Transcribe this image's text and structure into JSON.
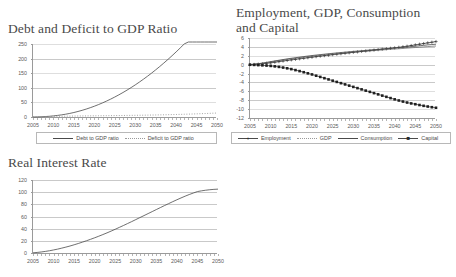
{
  "figure": {
    "background": "#ffffff",
    "grid_color": "#c9c9c9",
    "axis_color": "#9a9a9a",
    "line_color": "#4a4a4a"
  },
  "chart_data": [
    {
      "id": "debt-deficit",
      "type": "line",
      "title": "Debt and Deficit to GDP Ratio",
      "xlabel": "",
      "ylabel": "",
      "xlim": [
        2005,
        2050
      ],
      "ylim": [
        0,
        250
      ],
      "ytick_labels": [
        "250",
        "200",
        "150",
        "100",
        "50",
        "0"
      ],
      "yticks": [
        250,
        200,
        150,
        100,
        50,
        0
      ],
      "xtick_labels": [
        "2005",
        "2010",
        "2015",
        "2020",
        "2025",
        "2030",
        "2035",
        "2040",
        "2045",
        "2050"
      ],
      "xticks": [
        2005,
        2010,
        2015,
        2020,
        2025,
        2030,
        2035,
        2040,
        2045,
        2050
      ],
      "grid": true,
      "legend_position": "bottom",
      "x": [
        2005,
        2006,
        2007,
        2008,
        2009,
        2010,
        2011,
        2012,
        2013,
        2014,
        2015,
        2016,
        2017,
        2018,
        2019,
        2020,
        2021,
        2022,
        2023,
        2024,
        2025,
        2026,
        2027,
        2028,
        2029,
        2030,
        2031,
        2032,
        2033,
        2034,
        2035,
        2036,
        2037,
        2038,
        2039,
        2040,
        2041,
        2042,
        2043,
        2044,
        2045,
        2046,
        2047,
        2048,
        2049,
        2050
      ],
      "series": [
        {
          "name": "Debt to GDP ratio",
          "style": "solid",
          "marker": "none",
          "values": [
            0,
            0.3,
            0.8,
            1.5,
            2.5,
            3.8,
            5.4,
            7.3,
            9.6,
            12.3,
            15.4,
            18.9,
            22.8,
            27.1,
            31.8,
            36.9,
            42.4,
            48.3,
            54.6,
            61.3,
            68.4,
            75.9,
            83.8,
            92.1,
            100.8,
            109.9,
            119.4,
            129.3,
            139.6,
            150.3,
            161.4,
            172.9,
            184.8,
            197.1,
            209.8,
            222.9,
            236.4,
            250.3,
            264.6,
            279.3,
            294.4,
            309.9,
            325.8,
            342.1,
            358.8,
            375.9
          ]
        },
        {
          "name": "Deficit to GDP ratio",
          "style": "dotted",
          "marker": "none",
          "values": [
            0,
            0.4,
            0.8,
            1.2,
            1.6,
            2.0,
            2.3,
            2.6,
            2.9,
            3.1,
            3.3,
            3.5,
            3.7,
            3.8,
            4.0,
            4.1,
            4.3,
            4.4,
            4.6,
            4.7,
            4.9,
            5.0,
            5.2,
            5.4,
            5.6,
            5.8,
            6.0,
            6.2,
            6.5,
            6.7,
            7.0,
            7.3,
            7.6,
            7.9,
            8.3,
            8.6,
            9.0,
            9.4,
            9.8,
            10.3,
            10.8,
            11.3,
            11.8,
            12.4,
            13.0,
            13.6
          ]
        }
      ]
    },
    {
      "id": "employment-gdp-consumption-capital",
      "type": "line",
      "title": "Employment, GDP, Consumption and Capital",
      "xlabel": "",
      "ylabel": "",
      "xlim": [
        2005,
        2050
      ],
      "ylim": [
        -12,
        6
      ],
      "ytick_labels": [
        "6",
        "4",
        "2",
        "0",
        "-2",
        "-4",
        "-6",
        "-8",
        "-10",
        "-12"
      ],
      "yticks": [
        6,
        4,
        2,
        0,
        -2,
        -4,
        -6,
        -8,
        -10,
        -12
      ],
      "xtick_labels": [
        "2005",
        "2010",
        "2015",
        "2020",
        "2025",
        "2030",
        "2035",
        "2040",
        "2045",
        "2050"
      ],
      "xticks": [
        2005,
        2010,
        2015,
        2020,
        2025,
        2030,
        2035,
        2040,
        2045,
        2050
      ],
      "grid": true,
      "legend_position": "bottom",
      "x": [
        2005,
        2006,
        2007,
        2008,
        2009,
        2010,
        2011,
        2012,
        2013,
        2014,
        2015,
        2016,
        2017,
        2018,
        2019,
        2020,
        2021,
        2022,
        2023,
        2024,
        2025,
        2026,
        2027,
        2028,
        2029,
        2030,
        2031,
        2032,
        2033,
        2034,
        2035,
        2036,
        2037,
        2038,
        2039,
        2040,
        2041,
        2042,
        2043,
        2044,
        2045,
        2046,
        2047,
        2048,
        2049,
        2050
      ],
      "series": [
        {
          "name": "Employment",
          "style": "solid",
          "marker": "plus",
          "values": [
            0.0,
            0.05,
            0.12,
            0.2,
            0.3,
            0.42,
            0.55,
            0.68,
            0.82,
            0.95,
            1.08,
            1.2,
            1.32,
            1.44,
            1.56,
            1.68,
            1.8,
            1.92,
            2.03,
            2.14,
            2.25,
            2.36,
            2.46,
            2.57,
            2.67,
            2.78,
            2.88,
            2.98,
            3.08,
            3.18,
            3.28,
            3.38,
            3.48,
            3.58,
            3.68,
            3.78,
            3.9,
            4.02,
            4.15,
            4.3,
            4.45,
            4.6,
            4.75,
            4.9,
            5.05,
            5.2
          ]
        },
        {
          "name": "GDP",
          "style": "solid-thin",
          "marker": "none",
          "values": [
            0.0,
            0.08,
            0.18,
            0.3,
            0.44,
            0.6,
            0.75,
            0.9,
            1.04,
            1.18,
            1.31,
            1.44,
            1.56,
            1.68,
            1.79,
            1.9,
            2.0,
            2.1,
            2.2,
            2.29,
            2.38,
            2.47,
            2.56,
            2.64,
            2.72,
            2.8,
            2.88,
            2.96,
            3.03,
            3.1,
            3.17,
            3.24,
            3.31,
            3.38,
            3.45,
            3.52,
            3.58,
            3.65,
            3.72,
            3.79,
            3.86,
            3.93,
            4.0,
            4.07,
            4.14,
            4.2
          ]
        },
        {
          "name": "Consumption",
          "style": "solid",
          "marker": "none",
          "values": [
            0.0,
            0.1,
            0.22,
            0.36,
            0.52,
            0.68,
            0.84,
            1.0,
            1.15,
            1.3,
            1.44,
            1.57,
            1.7,
            1.82,
            1.94,
            2.05,
            2.16,
            2.26,
            2.36,
            2.46,
            2.55,
            2.64,
            2.73,
            2.81,
            2.9,
            2.98,
            3.06,
            3.14,
            3.22,
            3.3,
            3.37,
            3.45,
            3.52,
            3.6,
            3.67,
            3.74,
            3.81,
            3.88,
            3.95,
            4.05,
            4.15,
            4.25,
            4.35,
            4.45,
            4.53,
            4.6
          ]
        },
        {
          "name": "Capital",
          "style": "solid",
          "marker": "square",
          "values": [
            0.0,
            -0.05,
            -0.1,
            -0.15,
            -0.2,
            -0.28,
            -0.38,
            -0.5,
            -0.65,
            -0.82,
            -1.0,
            -1.22,
            -1.45,
            -1.7,
            -1.95,
            -2.2,
            -2.48,
            -2.76,
            -3.04,
            -3.32,
            -3.6,
            -3.88,
            -4.16,
            -4.44,
            -4.72,
            -5.0,
            -5.28,
            -5.56,
            -5.84,
            -6.12,
            -6.4,
            -6.68,
            -6.96,
            -7.24,
            -7.52,
            -7.8,
            -8.06,
            -8.3,
            -8.52,
            -8.72,
            -8.9,
            -9.08,
            -9.26,
            -9.42,
            -9.57,
            -9.7
          ]
        }
      ]
    },
    {
      "id": "real-interest-rate",
      "type": "line",
      "title": "Real Interest Rate",
      "xlabel": "",
      "ylabel": "",
      "xlim": [
        2005,
        2050
      ],
      "ylim": [
        0,
        120
      ],
      "ytick_labels": [
        "120",
        "100",
        "80",
        "60",
        "40",
        "20",
        "0"
      ],
      "yticks": [
        120,
        100,
        80,
        60,
        40,
        20,
        0
      ],
      "xtick_labels": [
        "2005",
        "2010",
        "2015",
        "2020",
        "2025",
        "2030",
        "2035",
        "2040",
        "2045",
        "2050"
      ],
      "xticks": [
        2005,
        2010,
        2015,
        2020,
        2025,
        2030,
        2035,
        2040,
        2045,
        2050
      ],
      "grid": true,
      "legend_position": "none",
      "x": [
        2005,
        2006,
        2007,
        2008,
        2009,
        2010,
        2011,
        2012,
        2013,
        2014,
        2015,
        2016,
        2017,
        2018,
        2019,
        2020,
        2021,
        2022,
        2023,
        2024,
        2025,
        2026,
        2027,
        2028,
        2029,
        2030,
        2031,
        2032,
        2033,
        2034,
        2035,
        2036,
        2037,
        2038,
        2039,
        2040,
        2041,
        2042,
        2043,
        2044,
        2045,
        2046,
        2047,
        2048,
        2049,
        2050
      ],
      "series": [
        {
          "name": "Real Interest Rate",
          "style": "solid",
          "marker": "none",
          "values": [
            0.3,
            0.9,
            1.7,
            2.6,
            3.7,
            5.0,
            6.4,
            8.0,
            9.7,
            11.5,
            13.5,
            15.6,
            17.8,
            20.1,
            22.5,
            25.0,
            27.6,
            30.3,
            33.1,
            36.0,
            39.0,
            42.1,
            45.2,
            48.4,
            51.6,
            54.9,
            58.2,
            61.5,
            64.8,
            68.1,
            71.4,
            74.7,
            78.0,
            81.2,
            84.4,
            87.5,
            90.5,
            93.4,
            96.1,
            98.6,
            101.0,
            102.2,
            103.2,
            104.0,
            104.6,
            105.0
          ]
        }
      ]
    }
  ],
  "legends": {
    "debt_deficit": [
      {
        "label": "Debt to GDP ratio",
        "style": "solid",
        "marker": "none"
      },
      {
        "label": "Deficit to GDP ratio",
        "style": "dotted",
        "marker": "none"
      }
    ],
    "emp_gdp": [
      {
        "label": "Employment",
        "style": "solid",
        "marker": "plus"
      },
      {
        "label": "GDP",
        "style": "dotted-thin",
        "marker": "none"
      },
      {
        "label": "Consumption",
        "style": "solid",
        "marker": "none"
      },
      {
        "label": "Capital",
        "style": "solid",
        "marker": "square"
      }
    ]
  }
}
